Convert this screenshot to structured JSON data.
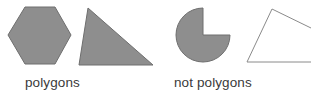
{
  "figure": {
    "name": "polygons-vs-not-polygons-diagram",
    "width": 311,
    "height": 93,
    "background_color": "#ffffff"
  },
  "colors": {
    "shape_fill": "#8e8e8e",
    "shape_stroke": "#6e6e6e",
    "outline_stroke": "#8a8a8a",
    "text": "#3a3a3a"
  },
  "groups": [
    {
      "id": "polygons",
      "label": "polygons",
      "label_x": 25,
      "label_y": 76
    },
    {
      "id": "not-polygons",
      "label": "not polygons",
      "label_x": 174,
      "label_y": 76
    }
  ],
  "shapes": [
    {
      "id": "hexagon",
      "name": "hexagon-shape",
      "group": "polygons",
      "kind": "polygon",
      "filled": true,
      "points": "25,7 55,7 71,35 55,64 25,64 8,35"
    },
    {
      "id": "triangle",
      "name": "triangle-shape",
      "group": "polygons",
      "kind": "polygon",
      "filled": true,
      "points": "88,8 153,65 79,65"
    },
    {
      "id": "pacman",
      "name": "circle-sector-shape",
      "group": "not-polygons",
      "kind": "circle-with-wedge-removed",
      "filled": true,
      "center_x": 203,
      "center_y": 35,
      "radius": 27,
      "path": "M 203 35 L 203 8 A 27 27 0 1 0 230 35 Z"
    },
    {
      "id": "open-quadrilateral",
      "name": "open-outline-shape",
      "group": "not-polygons",
      "kind": "open-polyline",
      "filled": false,
      "path": "M 247 62 L 272 9 L 311 28 M 247 62 L 311 62"
    }
  ]
}
